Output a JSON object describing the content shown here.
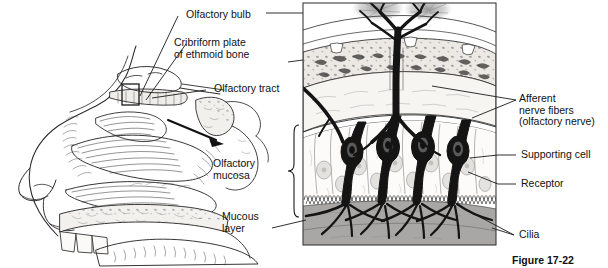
{
  "figure": {
    "caption": "Figure 17-22",
    "style": "black-and-white textbook line drawing with grayscale shading"
  },
  "panels": {
    "left": {
      "name": "sagittal-section-of-nasal-cavity",
      "description": "Mid-sagittal line drawing of the human nose and nasal cavity showing nasal conchae, hard palate, tongue and sphenoid region",
      "callout_box": "small rectangle over the roof of the nasal cavity marking the magnified region",
      "arrow": "bold arrow leading right from the nasal cavity to the magnified panel"
    },
    "right": {
      "name": "magnified-olfactory-epithelium",
      "description": "Boxed magnification of the olfactory mucosa, cribriform plate and olfactory bulb",
      "receptor_cell_count": 4
    }
  },
  "labels": {
    "olfactory_bulb": "Olfactory bulb",
    "cribriform_plate": "Cribriform plate\nof ethmoid bone",
    "olfactory_tract": "Olfactory tract",
    "afferent_nerve_fibers": "Afferent\nnerve fibers\n(olfactory nerve)",
    "supporting_cell": "Supporting cell",
    "receptor": "Receptor",
    "cilia": "Cilia",
    "olfactory_mucosa": "Olfactory\nmucosa",
    "mucous_layer": "Mucous\nlayer"
  },
  "colors": {
    "ink": "#1a1a1a",
    "line": "#2b2b2b",
    "bone_fill": "#e8e6e2",
    "epithelium_fill": "#fbfaf8",
    "mucous_layer_fill": "#a9a7a5",
    "glomerulus_gray": "#9a9a9a",
    "panel_border": "#3a3a3a",
    "background": "#ffffff"
  }
}
